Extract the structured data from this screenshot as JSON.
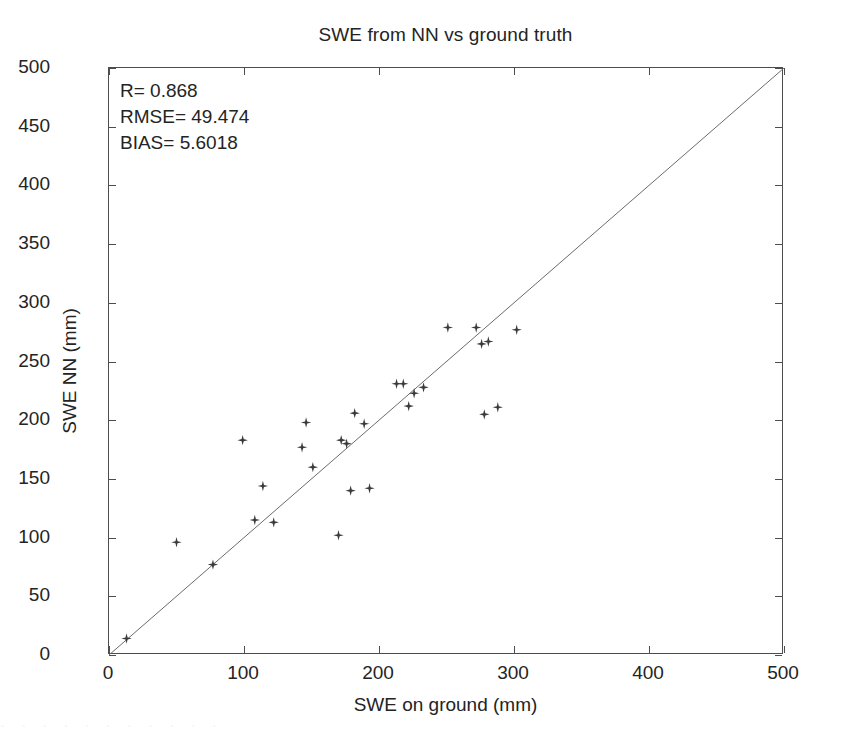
{
  "chart_data": {
    "type": "scatter",
    "title": "SWE from NN vs ground truth",
    "xlabel": "SWE on ground (mm)",
    "ylabel": "SWE NN (mm)",
    "xlim": [
      0,
      500
    ],
    "ylim": [
      0,
      500
    ],
    "xticks": [
      0,
      100,
      200,
      300,
      400,
      500
    ],
    "yticks": [
      0,
      50,
      100,
      150,
      200,
      250,
      300,
      350,
      400,
      450,
      500
    ],
    "xtick_labels": [
      "0",
      "100",
      "200",
      "300",
      "400",
      "500"
    ],
    "ytick_labels": [
      "0",
      "50",
      "100",
      "150",
      "200",
      "250",
      "300",
      "350",
      "400",
      "450",
      "500"
    ],
    "grid": false,
    "legend": null,
    "marker": "star",
    "marker_color": "#3b3b3b",
    "reference_line": {
      "name": "one-to-one line",
      "from": [
        0,
        0
      ],
      "to": [
        500,
        500
      ],
      "color": "#6b6b6b",
      "style": "solid"
    },
    "points": [
      {
        "x": 13,
        "y": 14
      },
      {
        "x": 50,
        "y": 96
      },
      {
        "x": 77,
        "y": 77
      },
      {
        "x": 99,
        "y": 183
      },
      {
        "x": 108,
        "y": 115
      },
      {
        "x": 114,
        "y": 144
      },
      {
        "x": 122,
        "y": 113
      },
      {
        "x": 143,
        "y": 177
      },
      {
        "x": 146,
        "y": 198
      },
      {
        "x": 151,
        "y": 160
      },
      {
        "x": 170,
        "y": 102
      },
      {
        "x": 172,
        "y": 183
      },
      {
        "x": 176,
        "y": 180
      },
      {
        "x": 179,
        "y": 140
      },
      {
        "x": 182,
        "y": 206
      },
      {
        "x": 189,
        "y": 197
      },
      {
        "x": 193,
        "y": 142
      },
      {
        "x": 213,
        "y": 231
      },
      {
        "x": 218,
        "y": 231
      },
      {
        "x": 222,
        "y": 212
      },
      {
        "x": 226,
        "y": 223
      },
      {
        "x": 233,
        "y": 228
      },
      {
        "x": 251,
        "y": 279
      },
      {
        "x": 272,
        "y": 279
      },
      {
        "x": 276,
        "y": 265
      },
      {
        "x": 281,
        "y": 267
      },
      {
        "x": 278,
        "y": 205
      },
      {
        "x": 288,
        "y": 211
      },
      {
        "x": 302,
        "y": 277
      }
    ],
    "stats": {
      "r_label": "R= 0.868",
      "rmse_label": "RMSE= 49.474",
      "bias_label": "BIAS= 5.6018",
      "r": 0.868,
      "rmse": 49.474,
      "bias": 5.6018
    }
  },
  "artifact": {
    "text": "·  ·   ·  ·    ·   ·  ·   ·    ·  ·   ·"
  }
}
